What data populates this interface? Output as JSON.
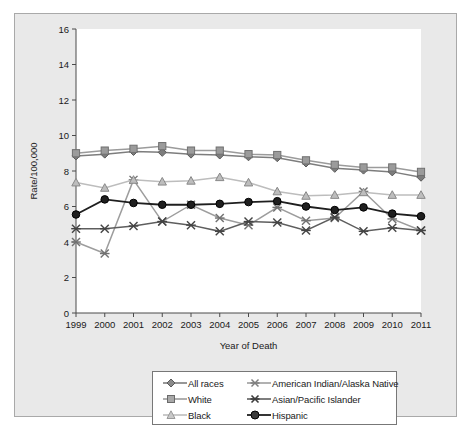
{
  "chart_data": {
    "type": "line",
    "title": "",
    "xlabel": "Year of Death",
    "ylabel": "Rate/100,000",
    "categories": [
      "1999",
      "2000",
      "2001",
      "2002",
      "2003",
      "2004",
      "2005",
      "2006",
      "2007",
      "2008",
      "2009",
      "2010",
      "2011"
    ],
    "x": [
      1999,
      2000,
      2001,
      2002,
      2003,
      2004,
      2005,
      2006,
      2007,
      2008,
      2009,
      2010,
      2011
    ],
    "ylim": [
      0,
      16
    ],
    "yticks": [
      0,
      2,
      4,
      6,
      8,
      10,
      12,
      14,
      16
    ],
    "grid": false,
    "legend_position": "bottom",
    "series": [
      {
        "name": "All races",
        "marker": "diamond",
        "color": "#7d7d7d",
        "values": [
          8.85,
          8.95,
          9.1,
          9.05,
          8.95,
          8.9,
          8.8,
          8.75,
          8.45,
          8.15,
          8.05,
          7.95,
          7.65
        ]
      },
      {
        "name": "White",
        "marker": "square",
        "color": "#9b9b9b",
        "values": [
          9.0,
          9.15,
          9.25,
          9.4,
          9.15,
          9.15,
          8.95,
          8.9,
          8.6,
          8.35,
          8.2,
          8.2,
          7.95
        ]
      },
      {
        "name": "Black",
        "marker": "triangle",
        "color": "#bdbdbd",
        "values": [
          7.35,
          7.05,
          7.5,
          7.4,
          7.45,
          7.65,
          7.35,
          6.85,
          6.6,
          6.65,
          6.8,
          6.65,
          6.65
        ]
      },
      {
        "name": "American Indian/Alaska Native",
        "marker": "star",
        "color": "#9d9d9d",
        "values": [
          4.0,
          3.35,
          7.5,
          5.15,
          6.1,
          5.35,
          4.95,
          5.95,
          5.2,
          5.35,
          6.85,
          5.3,
          4.65
        ]
      },
      {
        "name": "Asian/Pacific Islander",
        "marker": "star",
        "color": "#5e5e5e",
        "values": [
          4.75,
          4.75,
          4.9,
          5.15,
          4.95,
          4.6,
          5.15,
          5.1,
          4.65,
          5.4,
          4.6,
          4.8,
          4.65
        ]
      },
      {
        "name": "Hispanic",
        "marker": "circle",
        "color": "#1f1f1f",
        "values": [
          5.55,
          6.4,
          6.2,
          6.1,
          6.1,
          6.15,
          6.25,
          6.3,
          6.0,
          5.8,
          5.95,
          5.6,
          5.45
        ]
      }
    ]
  },
  "axes": {
    "y_title": "Rate/100,000",
    "x_title": "Year of Death",
    "y_tick_labels": [
      "16",
      "14",
      "12",
      "10",
      "8",
      "6",
      "4",
      "2",
      "0"
    ],
    "x_tick_labels": [
      "1999",
      "2000",
      "2001",
      "2002",
      "2003",
      "2004",
      "2005",
      "2006",
      "2007",
      "2008",
      "2009",
      "2010",
      "2011"
    ]
  },
  "legend": {
    "column_a": [
      {
        "label": "All races",
        "marker": "diamond",
        "color": "#7d7d7d"
      },
      {
        "label": "White",
        "marker": "square",
        "color": "#9b9b9b"
      },
      {
        "label": "Black",
        "marker": "triangle",
        "color": "#bdbdbd"
      }
    ],
    "column_b": [
      {
        "label": "American Indian/Alaska Native",
        "marker": "star",
        "color": "#9d9d9d"
      },
      {
        "label": "Asian/Pacific Islander",
        "marker": "star",
        "color": "#5e5e5e"
      },
      {
        "label": "Hispanic",
        "marker": "circle",
        "color": "#1f1f1f"
      }
    ]
  },
  "colors": {
    "frame_background": "#e9e9e9",
    "plot_background": "#ffffff",
    "frame_border": "#a9a9a9",
    "axis_line": "#4a4a4a",
    "text": "#1a1a1a"
  }
}
